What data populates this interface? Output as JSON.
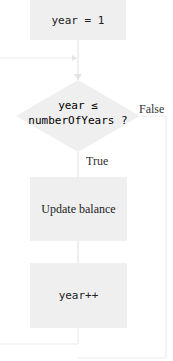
{
  "diagram": {
    "type": "flowchart",
    "nodes": {
      "init": {
        "label": "year = 1",
        "shape": "rectangle"
      },
      "condition": {
        "line1": "year ≤",
        "line2": "numberOfYears ?",
        "shape": "diamond"
      },
      "update": {
        "label": "Update balance",
        "shape": "rectangle"
      },
      "increment": {
        "label": "year++",
        "shape": "rectangle"
      }
    },
    "edges": {
      "true_label": "True",
      "false_label": "False"
    },
    "colors": {
      "node_fill": "#efefef",
      "line": "#e6e6e6",
      "text": "#222222"
    }
  }
}
